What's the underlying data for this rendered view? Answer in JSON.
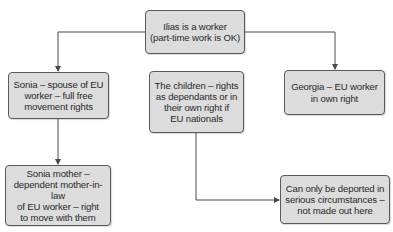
{
  "diagram": {
    "type": "flowchart",
    "colors": {
      "box_fill": "#dcdcdc",
      "box_border": "#5a5a5a",
      "connector": "#4a4a4a",
      "text": "#2a2a2a"
    },
    "nodes": {
      "ilias": {
        "label": "Ilias is a worker\n(part-time work is OK)"
      },
      "sonia": {
        "label": "Sonia – spouse of EU\nworker – full free\nmovement rights"
      },
      "children": {
        "label": "The children – rights\nas dependants or in\ntheir own right if\nEU nationals"
      },
      "georgia": {
        "label": "Georgia – EU worker\nin own right"
      },
      "sonia_mother": {
        "label": "Sonia mother –\ndependent mother-in-law\nof EU worker – right\nto move with them"
      },
      "deportation": {
        "label": "Can only be deported in\nserious circumstances –\nnot made out here"
      }
    },
    "edges": [
      {
        "from": "ilias",
        "to": "sonia"
      },
      {
        "from": "ilias",
        "to": "georgia"
      },
      {
        "from": "sonia",
        "to": "sonia_mother"
      },
      {
        "from": "children",
        "to": "deportation"
      }
    ]
  }
}
